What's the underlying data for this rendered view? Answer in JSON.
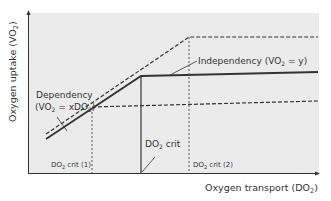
{
  "diagram": {
    "y_axis_label": "Oxygen uptake (VO",
    "y_axis_sub": "2",
    "y_axis_end": ")",
    "x_axis_label": "Oxygen transport (DO",
    "x_axis_sub": "2",
    "x_axis_end": ")",
    "dependency_label_line1": "Dependency",
    "dependency_label_line2_a": "(VO",
    "dependency_label_line2_sub1": "2",
    "dependency_label_line2_b": " = xDO",
    "dependency_label_line2_sub2": "2",
    "dependency_label_line2_c": ")",
    "independency_label_a": "Independency (VO",
    "independency_label_sub": "2",
    "independency_label_b": " = y)",
    "do2crit_a": "DO",
    "do2crit_sub": "2",
    "do2crit_b": " crit",
    "crit1_a": "DO",
    "crit1_sub": "2",
    "crit1_b": " crit (1)",
    "crit2_a": "DO",
    "crit2_sub": "2",
    "crit2_b": " crit (2)",
    "colors": {
      "plot_background": "#ebebeb",
      "line": "#333333"
    }
  }
}
